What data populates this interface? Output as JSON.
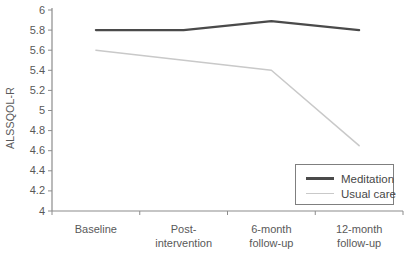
{
  "chart_data": {
    "type": "line",
    "categories": [
      "Baseline",
      "Post-\nintervention",
      "6-month\nfollow-up",
      "12-month\nfollow-up"
    ],
    "series": [
      {
        "name": "Meditation",
        "values": [
          5.8,
          5.8,
          5.89,
          5.8
        ],
        "color": "#4a4a4a",
        "stroke_width": 2.2
      },
      {
        "name": "Usual care",
        "values": [
          5.6,
          5.5,
          5.4,
          4.65
        ],
        "color": "#c9c9c9",
        "stroke_width": 1.5
      }
    ],
    "title": "",
    "xlabel": "",
    "ylabel": "ALSSQOL-R",
    "ylim": [
      4,
      6
    ],
    "ytick_step": 0.2,
    "grid": false,
    "legend_position": "bottom-right"
  },
  "styles": {
    "background": "#ffffff",
    "axis_color": "#8c8c8c",
    "tick_text_color": "#595959",
    "legend_border_color": "#7f7f7f",
    "legend_text_color": "#474747"
  }
}
